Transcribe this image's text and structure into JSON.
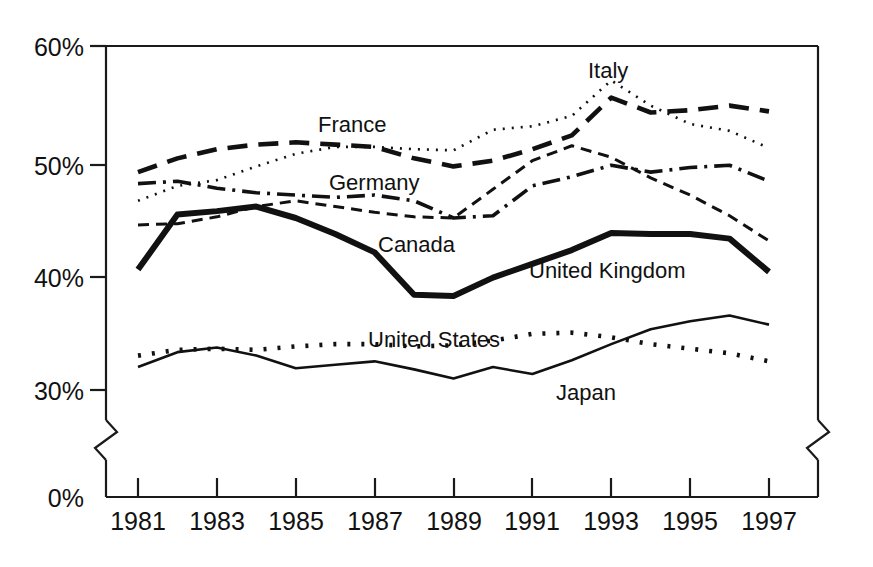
{
  "chart_data": {
    "type": "line",
    "title": "",
    "subtitle": "",
    "xlabel": "",
    "ylabel": "",
    "x": [
      1981,
      1982,
      1983,
      1984,
      1985,
      1986,
      1987,
      1988,
      1989,
      1990,
      1991,
      1992,
      1993,
      1994,
      1995,
      1996,
      1997
    ],
    "xlim": [
      1981,
      1997
    ],
    "ylim": [
      29,
      60
    ],
    "y_axis_break": true,
    "y_axis_break_between": [
      0,
      29
    ],
    "grid": false,
    "legend": "inline-labels",
    "x_tick_labels": [
      "1981",
      "1983",
      "1985",
      "1987",
      "1989",
      "1991",
      "1993",
      "1995",
      "1997"
    ],
    "x_tick_values": [
      1981,
      1983,
      1985,
      1987,
      1989,
      1991,
      1993,
      1995,
      1997
    ],
    "y_tick_labels": [
      "0%",
      "30%",
      "40%",
      "50%",
      "60%"
    ],
    "y_tick_values": [
      0,
      30,
      40,
      50,
      60
    ],
    "series": [
      {
        "name": "Italy",
        "label": "Italy",
        "style": "dotted-fine",
        "dash": "2,7",
        "width": 2.6,
        "color": "#111111",
        "label_x": 588,
        "label_y": 78,
        "values": [
          46.5,
          47.8,
          48.3,
          49.5,
          50.6,
          51.2,
          51.2,
          51.0,
          50.9,
          52.7,
          53.0,
          53.9,
          57.0,
          54.8,
          53.2,
          52.6,
          51.1
        ]
      },
      {
        "name": "France",
        "label": "France",
        "style": "long-dash",
        "dash": "20,11",
        "width": 4.6,
        "color": "#111111",
        "label_x": 318,
        "label_y": 132,
        "values": [
          49.0,
          50.2,
          51.0,
          51.4,
          51.6,
          51.4,
          51.2,
          50.2,
          49.5,
          50.0,
          51.0,
          52.2,
          55.5,
          54.2,
          54.4,
          54.8,
          54.3
        ]
      },
      {
        "name": "Germany",
        "label": "Germany",
        "style": "dash-dot",
        "dash": "18,7,3,7",
        "width": 3.6,
        "color": "#111111",
        "label_x": 329,
        "label_y": 190,
        "values": [
          48.0,
          48.2,
          47.6,
          47.2,
          47.0,
          46.8,
          47.0,
          46.5,
          45.0,
          45.2,
          47.8,
          48.6,
          49.6,
          49.0,
          49.4,
          49.6,
          48.2
        ]
      },
      {
        "name": "Canada",
        "label": "Canada",
        "style": "short-dash",
        "dash": "11,7",
        "width": 3.0,
        "color": "#111111",
        "label_x": 378,
        "label_y": 252,
        "values": [
          44.4,
          44.5,
          45.1,
          46.0,
          46.5,
          46.0,
          45.5,
          45.1,
          45.0,
          47.5,
          50.0,
          51.3,
          50.3,
          48.5,
          47.0,
          45.2,
          43.0
        ]
      },
      {
        "name": "United Kingdom",
        "label": "United Kingdom",
        "style": "bold-solid",
        "dash": "none",
        "width": 6.0,
        "color": "#111111",
        "label_x": 529,
        "label_y": 278,
        "values": [
          40.5,
          45.3,
          45.6,
          46.0,
          45.0,
          43.6,
          42.0,
          38.3,
          38.2,
          39.8,
          41.0,
          42.2,
          43.7,
          43.6,
          43.6,
          43.2,
          40.3
        ]
      },
      {
        "name": "United States",
        "label": "United States",
        "style": "dotted-coarse",
        "dash": "3,11",
        "width": 4.6,
        "color": "#111111",
        "label_x": 368,
        "label_y": 347,
        "values": [
          33.0,
          33.5,
          33.6,
          33.5,
          33.8,
          34.0,
          34.0,
          33.8,
          33.9,
          34.3,
          34.9,
          35.0,
          34.6,
          34.0,
          33.6,
          33.2,
          32.5
        ]
      },
      {
        "name": "Japan",
        "label": "Japan",
        "style": "thin-solid",
        "dash": "none",
        "width": 2.6,
        "color": "#111111",
        "label_x": 556,
        "label_y": 400,
        "values": [
          32.0,
          33.3,
          33.7,
          33.0,
          31.9,
          32.2,
          32.5,
          31.8,
          31.0,
          32.0,
          31.4,
          32.6,
          34.0,
          35.3,
          36.0,
          36.5,
          35.7
        ]
      }
    ]
  },
  "accessibility": {
    "chart_description": "Line chart of seven country series from 1981 to 1997"
  }
}
